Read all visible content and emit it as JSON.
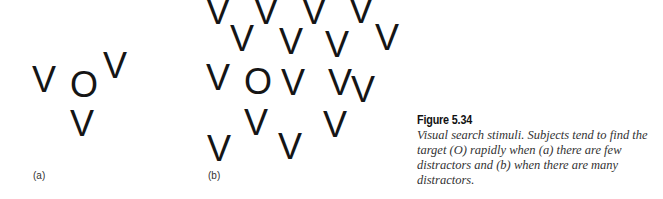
{
  "figure": {
    "panels": [
      {
        "label": "(a)",
        "label_pos": [
          33,
          170
        ],
        "items": [
          {
            "glyph": "V",
            "x": 32,
            "y": 62
          },
          {
            "glyph": "O",
            "x": 70,
            "y": 67
          },
          {
            "glyph": "V",
            "x": 103,
            "y": 48
          },
          {
            "glyph": "V",
            "x": 70,
            "y": 106
          }
        ]
      },
      {
        "label": "(b)",
        "label_pos": [
          208,
          170
        ],
        "items": [
          {
            "glyph": "V",
            "x": 206,
            "y": -6
          },
          {
            "glyph": "V",
            "x": 254,
            "y": -6
          },
          {
            "glyph": "V",
            "x": 302,
            "y": -6
          },
          {
            "glyph": "V",
            "x": 349,
            "y": -7
          },
          {
            "glyph": "V",
            "x": 230,
            "y": 21
          },
          {
            "glyph": "V",
            "x": 279,
            "y": 24
          },
          {
            "glyph": "V",
            "x": 325,
            "y": 27
          },
          {
            "glyph": "V",
            "x": 375,
            "y": 20
          },
          {
            "glyph": "V",
            "x": 206,
            "y": 60
          },
          {
            "glyph": "O",
            "x": 244,
            "y": 64
          },
          {
            "glyph": "V",
            "x": 281,
            "y": 65
          },
          {
            "glyph": "V",
            "x": 328,
            "y": 65
          },
          {
            "glyph": "V",
            "x": 351,
            "y": 72
          },
          {
            "glyph": "V",
            "x": 244,
            "y": 105
          },
          {
            "glyph": "V",
            "x": 323,
            "y": 107
          },
          {
            "glyph": "V",
            "x": 207,
            "y": 131
          },
          {
            "glyph": "V",
            "x": 278,
            "y": 129
          }
        ]
      }
    ],
    "caption": {
      "title": "Figure 5.34",
      "text": "Visual search stimuli. Subjects tend to find the target (O) rapidly when (a) there are few distractors and (b) when there are many distractors."
    }
  }
}
